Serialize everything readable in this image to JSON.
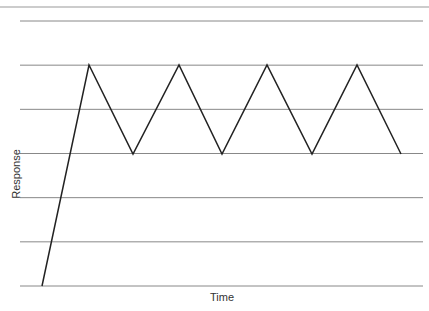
{
  "chart_data": {
    "type": "line",
    "title": "",
    "xlabel": "Time",
    "ylabel": "Response",
    "grid": true,
    "legend": null,
    "ylim": [
      0,
      6
    ],
    "xlim": [
      0,
      9
    ],
    "y_gridlines": [
      0,
      1,
      2,
      3,
      4,
      5,
      6
    ],
    "series": [
      {
        "name": "Response",
        "x": [
          0,
          1,
          2,
          3,
          4,
          5,
          6,
          7,
          8,
          9
        ],
        "y": [
          0,
          5,
          3,
          5,
          3,
          5,
          3,
          5,
          3,
          3
        ]
      }
    ],
    "points_px": [
      [
        42,
        286
      ],
      [
        89,
        65
      ],
      [
        133,
        154
      ],
      [
        179,
        65
      ],
      [
        222,
        154
      ],
      [
        267,
        65
      ],
      [
        312,
        154
      ],
      [
        357,
        65
      ],
      [
        401,
        154
      ]
    ],
    "colors": {
      "line": "#222222",
      "grid": "#888888"
    }
  }
}
